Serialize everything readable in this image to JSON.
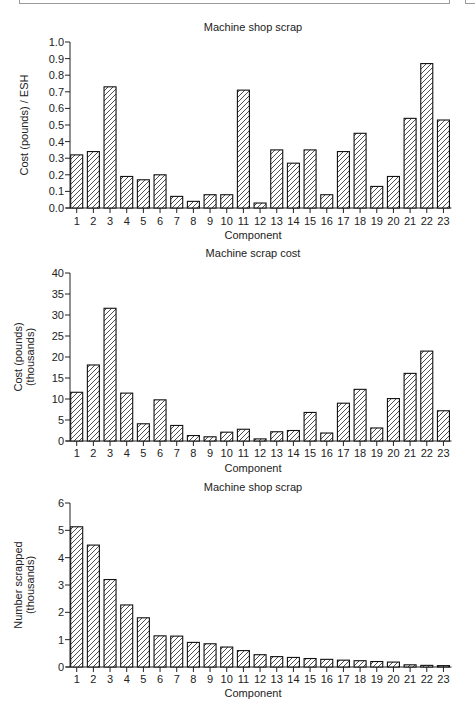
{
  "chart_data": [
    {
      "type": "bar",
      "title": "Machine shop scrap",
      "xlabel": "Component",
      "ylabel": "Cost (pounds) / ESH",
      "ylim": [
        0,
        1.0
      ],
      "yticks": [
        0.0,
        0.1,
        0.2,
        0.3,
        0.4,
        0.5,
        0.6,
        0.7,
        0.8,
        0.9,
        1.0
      ],
      "ytick_labels": [
        "0.0",
        "0.1",
        "0.2",
        "0.3",
        "0.4",
        "0.5",
        "0.6",
        "0.7",
        "0.8",
        "0.9",
        "1.0"
      ],
      "categories": [
        "1",
        "2",
        "3",
        "4",
        "5",
        "6",
        "7",
        "8",
        "9",
        "10",
        "11",
        "12",
        "13",
        "14",
        "15",
        "16",
        "17",
        "18",
        "19",
        "20",
        "21",
        "22",
        "23"
      ],
      "values": [
        0.32,
        0.34,
        0.73,
        0.19,
        0.17,
        0.2,
        0.07,
        0.04,
        0.08,
        0.08,
        0.71,
        0.03,
        0.35,
        0.27,
        0.35,
        0.08,
        0.34,
        0.45,
        0.13,
        0.19,
        0.54,
        0.87,
        0.53
      ],
      "grid": false,
      "fill": "diagonal hatch"
    },
    {
      "type": "bar",
      "title": "Machine scrap cost",
      "xlabel": "Component",
      "ylabel": "Cost (pounds) (thousands)",
      "ylabel_lines": [
        "Cost (pounds)",
        "(thousands)"
      ],
      "ylim": [
        0,
        40
      ],
      "yticks": [
        0,
        5,
        10,
        15,
        20,
        25,
        30,
        35,
        40
      ],
      "ytick_labels": [
        "0",
        "5",
        "10",
        "15",
        "20",
        "25",
        "30",
        "35",
        "40"
      ],
      "categories": [
        "1",
        "2",
        "3",
        "4",
        "5",
        "6",
        "7",
        "8",
        "9",
        "10",
        "11",
        "12",
        "13",
        "14",
        "15",
        "16",
        "17",
        "18",
        "19",
        "20",
        "21",
        "22",
        "23"
      ],
      "values": [
        11.6,
        18.1,
        31.6,
        11.4,
        4.1,
        9.8,
        3.7,
        1.3,
        1.0,
        2.1,
        2.8,
        0.5,
        2.2,
        2.5,
        6.8,
        1.9,
        9.0,
        12.3,
        3.1,
        10.1,
        16.1,
        21.4,
        7.2
      ],
      "grid": false,
      "fill": "diagonal hatch"
    },
    {
      "type": "bar",
      "title": "Machine shop scrap",
      "xlabel": "Component",
      "ylabel": "Number scrapped (thousands)",
      "ylabel_lines": [
        "Number scrapped",
        "(thousands)"
      ],
      "ylim": [
        0,
        6
      ],
      "yticks": [
        0,
        1,
        2,
        3,
        4,
        5,
        6
      ],
      "ytick_labels": [
        "0",
        "1",
        "2",
        "3",
        "4",
        "5",
        "6"
      ],
      "categories": [
        "1",
        "2",
        "3",
        "4",
        "5",
        "6",
        "7",
        "8",
        "9",
        "10",
        "11",
        "12",
        "13",
        "14",
        "15",
        "16",
        "17",
        "18",
        "19",
        "20",
        "21",
        "22",
        "23"
      ],
      "values": [
        5.13,
        4.46,
        3.2,
        2.27,
        1.8,
        1.14,
        1.13,
        0.9,
        0.85,
        0.73,
        0.6,
        0.45,
        0.38,
        0.35,
        0.31,
        0.28,
        0.25,
        0.23,
        0.2,
        0.18,
        0.08,
        0.06,
        0.05
      ],
      "grid": false,
      "fill": "diagonal hatch"
    }
  ],
  "layout": {
    "charts": [
      {
        "title_y": 31,
        "y_top": 42,
        "y_base": 208,
        "xtick_label_y": 225,
        "xlabel_y": 239,
        "ylabel_x": 24,
        "ylabel_cy": 125
      },
      {
        "title_y": 257,
        "y_top": 273,
        "y_base": 441,
        "xtick_label_y": 457,
        "xlabel_y": 472,
        "ylabel_x": 22,
        "ylabel_cy": 357
      },
      {
        "title_y": 491,
        "y_top": 503,
        "y_base": 667,
        "xtick_label_y": 683,
        "xlabel_y": 697,
        "ylabel_x": 22,
        "ylabel_cy": 585
      }
    ],
    "axis_x": 70,
    "first_tick_x": 76.7,
    "tick_spacing": 16.67,
    "bar_width": 12
  }
}
